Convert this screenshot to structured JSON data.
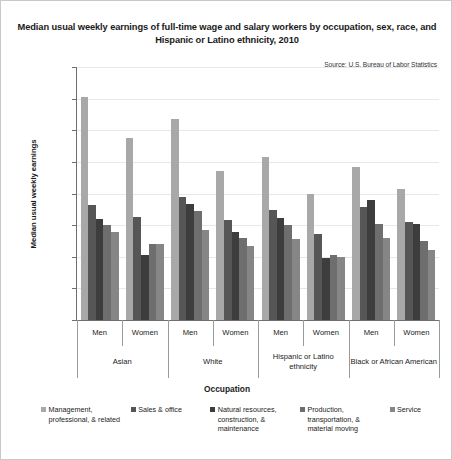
{
  "chart": {
    "title": "Median usual weekly earnings of full-time wage and salary workers by occupation, sex, race, and Hispanic or Latino ethnicity, 2010",
    "source": "Source: U.S. Bureau of Labor Statistics",
    "ylabel": "Median usual weekly earnings",
    "xlabel": "Occupation"
  },
  "chart_data": {
    "type": "bar",
    "title": "Median usual weekly earnings of full-time wage and salary workers by occupation, sex, race, and Hispanic or Latino ethnicity, 2010",
    "subtitle": "Source: U.S. Bureau of Labor Statistics",
    "xlabel": "Occupation",
    "ylabel": "Median usual weekly earnings",
    "ylim": [
      0,
      1600
    ],
    "ytick_labels": [
      "$0",
      "$200",
      "$400",
      "$600",
      "$800",
      "$1,000",
      "$1,200",
      "$1,400",
      "$1,600"
    ],
    "ytick_values": [
      0,
      200,
      400,
      600,
      800,
      1000,
      1200,
      1400,
      1600
    ],
    "grid": true,
    "legend_position": "bottom",
    "categories": [
      "Men",
      "Women",
      "Men",
      "Women",
      "Men",
      "Women",
      "Men",
      "Women"
    ],
    "group_labels": [
      "Asian",
      "White",
      "Hispanic or Latino ethnicity",
      "Black or African American"
    ],
    "series": [
      {
        "name": "Management, professional, & related",
        "color": "#a8a8a8",
        "values": [
          1410,
          1150,
          1273,
          940,
          1030,
          800,
          970,
          830
        ]
      },
      {
        "name": "Sales & office",
        "color": "#565656",
        "values": [
          725,
          650,
          775,
          630,
          695,
          545,
          715,
          620
        ]
      },
      {
        "name": "Natural resources, construction, & maintenance",
        "color": "#3d3d3d",
        "values": [
          640,
          410,
          735,
          555,
          645,
          395,
          760,
          610
        ]
      },
      {
        "name": "Production, transportation, & material moving",
        "color": "#6e6e6e",
        "values": [
          600,
          480,
          690,
          520,
          600,
          410,
          605,
          500
        ]
      },
      {
        "name": "Service",
        "color": "#868686",
        "values": [
          555,
          480,
          570,
          465,
          510,
          400,
          520,
          440
        ]
      }
    ]
  },
  "legend": {
    "items": [
      {
        "label": "Management, professional, & related",
        "color": "#a8a8a8"
      },
      {
        "label": "Sales & office",
        "color": "#565656"
      },
      {
        "label": "Natural resources, construction, & maintenance",
        "color": "#3d3d3d"
      },
      {
        "label": "Production, transportation, & material moving",
        "color": "#6e6e6e"
      },
      {
        "label": "Service",
        "color": "#868686"
      }
    ]
  }
}
